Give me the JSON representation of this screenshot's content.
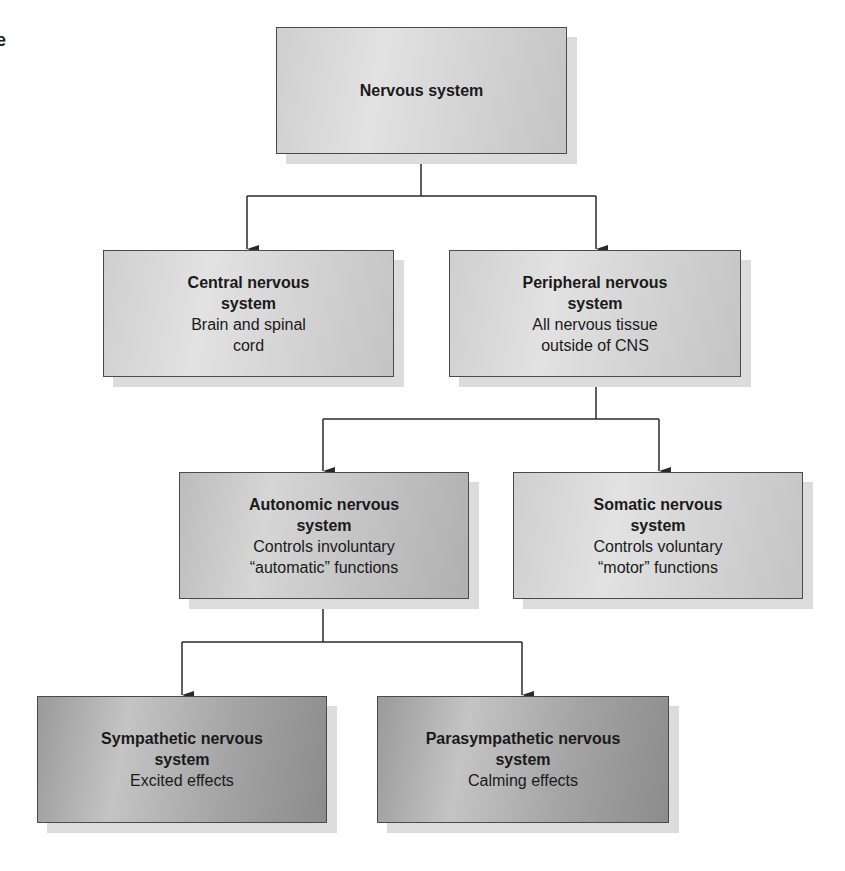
{
  "diagram": {
    "stray_glyph": "e",
    "nodes": {
      "root": {
        "title": "Nervous system",
        "desc": ""
      },
      "cns": {
        "title_line1": "Central nervous",
        "title_line2": "system",
        "desc_line1": "Brain and spinal",
        "desc_line2": "cord"
      },
      "pns": {
        "title_line1": "Peripheral nervous",
        "title_line2": "system",
        "desc_line1": "All nervous tissue",
        "desc_line2": "outside of CNS"
      },
      "autonomic": {
        "title_line1": "Autonomic nervous",
        "title_line2": "system",
        "desc_line1": "Controls involuntary",
        "desc_line2": "“automatic” functions"
      },
      "somatic": {
        "title_line1": "Somatic nervous",
        "title_line2": "system",
        "desc_line1": "Controls voluntary",
        "desc_line2": "“motor” functions"
      },
      "sympathetic": {
        "title_line1": "Sympathetic nervous",
        "title_line2": "system",
        "desc_line1": "Excited effects"
      },
      "parasympathetic": {
        "title_line1": "Parasympathetic nervous",
        "title_line2": "system",
        "desc_line1": "Calming effects"
      }
    },
    "edges": [
      {
        "from": "Nervous system",
        "to": "Central nervous system"
      },
      {
        "from": "Nervous system",
        "to": "Peripheral nervous system"
      },
      {
        "from": "Peripheral nervous system",
        "to": "Autonomic nervous system"
      },
      {
        "from": "Peripheral nervous system",
        "to": "Somatic nervous system"
      },
      {
        "from": "Autonomic nervous system",
        "to": "Sympathetic nervous system"
      },
      {
        "from": "Autonomic nervous system",
        "to": "Parasympathetic nervous system"
      }
    ],
    "colors": {
      "line": "#2a2a2a",
      "shadow": "#dcdcdc",
      "light_box": "#d6d6d6",
      "mid_box": "#c4c4c4",
      "dark_box": "#a8a8a8"
    }
  }
}
